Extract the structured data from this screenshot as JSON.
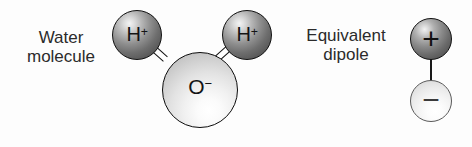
{
  "figure": {
    "background_color": "#fdfdfd"
  },
  "water": {
    "label_line1": "Water",
    "label_line2": "molecule",
    "atoms": [
      {
        "id": "h-left",
        "symbol": "H",
        "charge": "+",
        "kind": "hydrogen",
        "fill": "#6e6e6e"
      },
      {
        "id": "h-right",
        "symbol": "H",
        "charge": "+",
        "kind": "hydrogen",
        "fill": "#6e6e6e"
      },
      {
        "id": "o",
        "symbol": "O",
        "charge": "−",
        "kind": "oxygen",
        "fill": "#e2e2e2"
      }
    ],
    "bond_count": 2
  },
  "dipole": {
    "label_line1": "Equivalent",
    "label_line2": "dipole",
    "poles": [
      {
        "id": "plus",
        "sign": "+",
        "fill": "#6b6b6b"
      },
      {
        "id": "minus",
        "sign": "−",
        "fill": "#eaeaea"
      }
    ]
  },
  "colors": {
    "outline": "#101010",
    "text": "#2b2b2b",
    "glyph": "#141414"
  }
}
